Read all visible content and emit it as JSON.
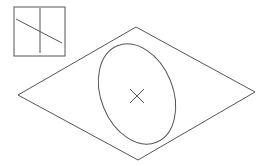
{
  "diagram": {
    "stroke_color": "#555555",
    "background": "#ffffff",
    "inset_box": {
      "x": 14,
      "y": 7,
      "width": 51,
      "height": 49
    },
    "inset_vertical_line": {
      "x1": 40,
      "y1": 8,
      "x2": 40,
      "y2": 53
    },
    "inset_diagonal_line": {
      "x1": 16,
      "y1": 19,
      "x2": 62,
      "y2": 43
    },
    "rhombus_points": [
      [
        136,
        27
      ],
      [
        255,
        92
      ],
      [
        138,
        160
      ],
      [
        18,
        95
      ]
    ],
    "ellipse": {
      "cx": 137,
      "cy": 94,
      "rx": 36,
      "ry": 52,
      "rotation": -22
    },
    "center_cross": {
      "cx": 137,
      "cy": 96,
      "size": 7
    }
  }
}
